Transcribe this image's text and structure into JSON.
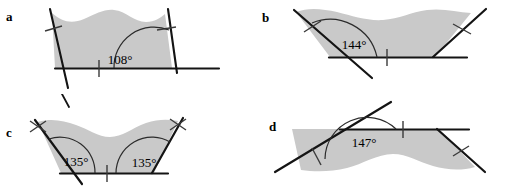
{
  "figure": {
    "fill_color": "#c9c9c9",
    "stroke_color": "#141414",
    "arc_color": "#2b2b2b",
    "background": "#ffffff"
  },
  "panels": [
    {
      "id": "a",
      "label": "a",
      "angles": [
        "108°"
      ],
      "tick_marks": 3,
      "description": "Trapezoid-like region with wavy top edge, two slanted sides extending past the base, angle of 108 degrees at lower-right vertex"
    },
    {
      "id": "b",
      "label": "b",
      "angles": [
        "144°"
      ],
      "tick_marks": 3,
      "description": "Wavy-topped region with slanted left side extending past the base and a slanted right side, angle of 144 degrees at lower-left vertex"
    },
    {
      "id": "c",
      "label": "c",
      "angles": [
        "135°",
        "135°"
      ],
      "tick_marks": 5,
      "description": "Low wavy region with two slanted sides, both base angles measuring 135 degrees"
    },
    {
      "id": "d",
      "label": "d",
      "angles": [
        "147°"
      ],
      "tick_marks": 3,
      "description": "Wide flat region with wavy bottom edge, slanted left side extended past the top edge, angle of 147 degrees at upper-left vertex"
    }
  ]
}
